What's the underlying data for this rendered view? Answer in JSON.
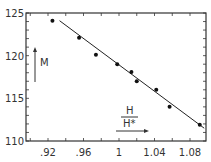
{
  "chart_data": {
    "type": "scatter",
    "title": "",
    "xlabel": "H / H*",
    "ylabel": "M",
    "xlim": [
      0.9,
      1.1
    ],
    "ylim": [
      110,
      125
    ],
    "x_ticks": [
      0.92,
      0.96,
      1.0,
      1.04,
      1.08
    ],
    "x_tick_labels": [
      ".92",
      ".96",
      "1",
      "1.04",
      "1.08"
    ],
    "y_ticks": [
      110,
      115,
      120,
      125
    ],
    "y_tick_labels": [
      "110",
      "115",
      "120",
      "125"
    ],
    "grid": false,
    "legend": null,
    "series": [
      {
        "name": "measured",
        "type": "scatter",
        "x": [
          0.925,
          0.955,
          0.974,
          0.998,
          1.014,
          1.02,
          1.042,
          1.057,
          1.091
        ],
        "y": [
          124.1,
          122.1,
          120.1,
          119.0,
          118.1,
          117.0,
          116.0,
          114.0,
          111.9
        ]
      },
      {
        "name": "fit",
        "type": "line",
        "x": [
          0.933,
          1.096
        ],
        "y": [
          124.1,
          111.5
        ]
      }
    ]
  },
  "labels": {
    "y_axis": "M",
    "x_axis_num": "H",
    "x_axis_den": "H*"
  }
}
